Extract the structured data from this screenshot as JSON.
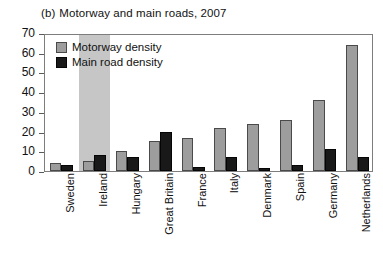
{
  "chart_data": {
    "type": "bar",
    "title_index": "(b)",
    "title_text": "Motorway and main roads, 2007",
    "xlabel": "",
    "ylabel": "",
    "ylim": [
      0,
      70
    ],
    "yticks": [
      0,
      10,
      20,
      30,
      40,
      50,
      60,
      70
    ],
    "ytick_labels": [
      "0",
      "10",
      "20",
      "30",
      "40",
      "50",
      "60",
      "70"
    ],
    "grid": false,
    "legend_position": "top-left inside",
    "highlight_category": "Ireland",
    "categories": [
      "Sweden",
      "Ireland",
      "Hungary",
      "Great Britain",
      "France",
      "Italy",
      "Denmark",
      "Spain",
      "Germany",
      "Netherlands"
    ],
    "series": [
      {
        "name": "Motorway density",
        "color": "#9d9d9d",
        "values": [
          4,
          5,
          10,
          15,
          17,
          22,
          24,
          26,
          36,
          64
        ]
      },
      {
        "name": "Main road density",
        "color": "#191919",
        "values": [
          3,
          8,
          7,
          20,
          2,
          7,
          1.5,
          3,
          11,
          7
        ]
      }
    ]
  },
  "colors": {
    "motorway": "#9d9d9d",
    "main_road": "#191919",
    "highlight_band": "#c6c6c6",
    "frame": "#7d7d7d",
    "background": "#ffffff"
  }
}
